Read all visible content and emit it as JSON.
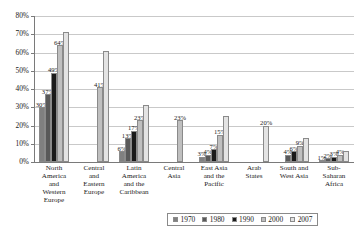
{
  "chart_data": {
    "type": "bar",
    "title": "",
    "subtitle": "",
    "xlabel": "",
    "ylabel": "",
    "ylim": [
      0,
      80
    ],
    "ytick_labels": [
      "0%",
      "10%",
      "20%",
      "30%",
      "40%",
      "50%",
      "60%",
      "70%",
      "80%"
    ],
    "ytick_values": [
      0,
      10,
      20,
      30,
      40,
      50,
      60,
      70,
      80
    ],
    "grid": true,
    "legend_position": "bottom",
    "categories": [
      "North America and Western Europe",
      "Central and Eastern Europe",
      "Latin America and the Caribbean",
      "Central Asia",
      "East Asia and the Pacific",
      "Arab States",
      "South and West Asia",
      "Sub-Saharan Africa"
    ],
    "category_lines": [
      [
        "North",
        "America",
        "and",
        "Western",
        "Europe"
      ],
      [
        "Central",
        "and",
        "Eastern",
        "Europe"
      ],
      [
        "Latin",
        "America",
        "and the",
        "Caribbean"
      ],
      [
        "Central",
        "Asia"
      ],
      [
        "East Asia",
        "and the",
        "Pacific"
      ],
      [
        "Arab",
        "States"
      ],
      [
        "South and",
        "West Asia"
      ],
      [
        "Sub-",
        "Saharan",
        "Africa"
      ]
    ],
    "series": [
      {
        "name": "1970",
        "color": "#808080",
        "values": [
          30,
          null,
          6,
          null,
          3,
          null,
          null,
          1
        ],
        "labels": [
          "30%",
          "",
          "6%",
          "",
          "3%",
          "",
          "",
          "1%"
        ]
      },
      {
        "name": "1980",
        "color": "#595959",
        "values": [
          37,
          null,
          13,
          null,
          4,
          null,
          4,
          2
        ],
        "labels": [
          "37%",
          "",
          "13%",
          "",
          "4%",
          "",
          "4%",
          "2%"
        ]
      },
      {
        "name": "1990",
        "color": "#1a1a1a",
        "values": [
          49,
          null,
          17,
          null,
          7,
          null,
          6,
          3
        ],
        "labels": [
          "49%",
          "",
          "17%",
          "",
          "7%",
          "",
          "6%",
          "3%"
        ]
      },
      {
        "name": "2000",
        "color": "#bfbfbf",
        "values": [
          64,
          41,
          23,
          23,
          15,
          null,
          9,
          4
        ],
        "labels": [
          "64%",
          "41%",
          "23%",
          "23%",
          "15%",
          "",
          "9%",
          "4%"
        ]
      },
      {
        "name": "2007",
        "color": "#e3e3e3",
        "values": [
          71,
          61,
          31,
          null,
          25,
          20,
          13,
          6
        ],
        "labels": [
          "",
          "",
          "",
          "",
          "",
          "20%",
          "",
          ""
        ]
      }
    ]
  }
}
